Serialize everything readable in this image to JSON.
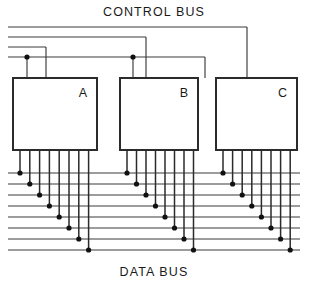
{
  "diagram": {
    "title_top": "CONTROL  BUS",
    "title_bottom": "DATA  BUS",
    "line_color": "#3a3a3a",
    "block_stroke": "#2b2b2b",
    "junction_color": "#111111",
    "background": "#ffffff",
    "blocks": [
      {
        "label": "A",
        "x": 13,
        "y": 78,
        "width": 84,
        "height": 72
      },
      {
        "label": "B",
        "x": 120,
        "y": 78,
        "width": 78,
        "height": 72
      },
      {
        "label": "C",
        "x": 216,
        "y": 78,
        "width": 81,
        "height": 72
      }
    ],
    "control_bus": {
      "count": 4,
      "lines": [
        {
          "y": 27,
          "x_start": 8,
          "x_end": 247
        },
        {
          "y": 37,
          "x_start": 8,
          "x_end": 146
        },
        {
          "y": 47,
          "x_start": 8,
          "x_end": 46
        },
        {
          "y": 57,
          "x_start": 8,
          "x_end": 205
        }
      ],
      "drops": [
        {
          "x": 247,
          "y_from": 27,
          "y_to": 78
        },
        {
          "x": 146,
          "y_from": 37,
          "y_to": 78
        },
        {
          "x": 46,
          "y_from": 47,
          "y_to": 78
        },
        {
          "x": 205,
          "y_from": 57,
          "y_to": 78
        },
        {
          "x": 27,
          "y_from": 57,
          "y_to": 78
        },
        {
          "x": 133,
          "y_from": 57,
          "y_to": 78
        }
      ],
      "junctions": [
        {
          "x": 27,
          "y": 57
        },
        {
          "x": 133,
          "y": 57
        }
      ]
    },
    "data_bus": {
      "line_count": 8,
      "first_line_y": 173,
      "line_spacing": 11,
      "x_start": 8,
      "x_end": 300,
      "pins_per_block": 8,
      "block_pin_spans": [
        {
          "x_first": 20,
          "x_step": 9.8
        },
        {
          "x_first": 127,
          "x_step": 9.5
        },
        {
          "x_first": 223,
          "x_step": 9.6
        }
      ]
    }
  }
}
